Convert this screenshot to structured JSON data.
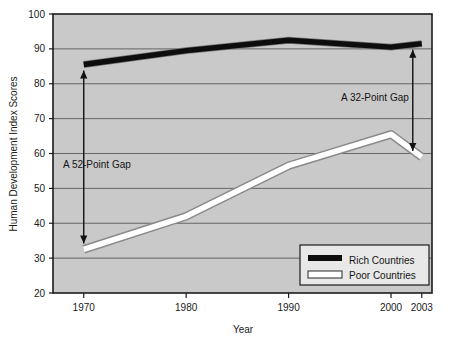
{
  "chart_data": {
    "type": "line",
    "title": "",
    "xlabel": "Year",
    "ylabel": "Human Development Index Scores",
    "x": [
      1970,
      1980,
      1990,
      2000,
      2003
    ],
    "xtick_labels": [
      "1970",
      "1980",
      "1990",
      "2000",
      "2003"
    ],
    "ytick_labels": [
      "20",
      "30",
      "40",
      "50",
      "60",
      "70",
      "80",
      "90",
      "100"
    ],
    "ytick_values": [
      20,
      30,
      40,
      50,
      60,
      70,
      80,
      90,
      100
    ],
    "ylim": [
      20,
      100
    ],
    "xlim": [
      1967,
      2004
    ],
    "grid": "horizontal",
    "legend_position": "bottom-right",
    "plot_background": "#c9c9c9",
    "series": [
      {
        "name": "Rich Countries",
        "values": [
          85.5,
          89.5,
          92.5,
          90.5,
          91.5
        ],
        "color": "#0d0d0d",
        "style": "thick-solid-black"
      },
      {
        "name": "Poor Countries",
        "values": [
          32.5,
          42.0,
          56.5,
          65.5,
          59.0
        ],
        "color": "#ffffff",
        "style": "thick-white-outlined"
      }
    ],
    "annotations": [
      {
        "text": "A  52-Point Gap",
        "kind": "double-arrow",
        "at_x": 1970,
        "from_value": 85.5,
        "to_value": 32.5,
        "gap": 52
      },
      {
        "text": "A  32-Point Gap",
        "kind": "double-arrow",
        "at_x": 2003,
        "from_value": 91.5,
        "to_value": 59.0,
        "gap": 32
      }
    ]
  },
  "legend": {
    "items": [
      {
        "label": "Rich Countries",
        "swatch": "black-line"
      },
      {
        "label": "Poor Countries",
        "swatch": "white-line"
      }
    ]
  },
  "axes": {
    "y_title": "Human Development Index Scores",
    "x_title": "Year",
    "y_ticks": [
      "100",
      "90",
      "80",
      "70",
      "60",
      "50",
      "40",
      "30",
      "20"
    ],
    "x_ticks": [
      "1970",
      "1980",
      "1990",
      "2000",
      "2003"
    ]
  },
  "annotations": {
    "left_gap_label": "A  52-Point Gap",
    "right_gap_label": "A  32-Point Gap"
  },
  "colors": {
    "plot_bg": "#c9c9c9",
    "page_bg": "#ffffff",
    "axis": "#1c1c1c",
    "grid": "#5a5a5a",
    "rich_line": "#0d0d0d",
    "poor_line": "#ffffff",
    "poor_line_edge": "#8a8a8a"
  }
}
